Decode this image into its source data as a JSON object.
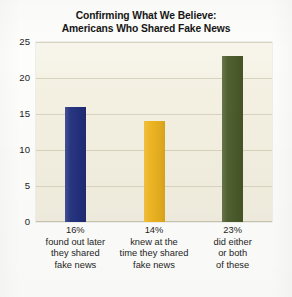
{
  "chart_data": {
    "type": "bar",
    "title": "Confirming What We Believe: Americans Who Shared Fake News",
    "title_lines": [
      "Confirming What We Believe:",
      "Americans Who Shared Fake News"
    ],
    "xlabel": "",
    "ylabel": "",
    "ylim": [
      0,
      25
    ],
    "yticks": [
      0,
      5,
      10,
      15,
      20,
      25
    ],
    "ytick_labels": [
      "0",
      "5",
      "10",
      "15",
      "20",
      "25"
    ],
    "grid": true,
    "legend": "none",
    "categories": [
      "16%",
      "14%",
      "23%"
    ],
    "values": [
      16,
      14,
      23
    ],
    "bars": [
      {
        "value": 16,
        "percent_label": "16%",
        "description_lines": [
          "found out later",
          "they shared",
          "fake news"
        ],
        "color": "#22307E"
      },
      {
        "value": 14,
        "percent_label": "14%",
        "description_lines": [
          "knew at the",
          "time they shared",
          "fake news"
        ],
        "color": "#EFB51F"
      },
      {
        "value": 23,
        "percent_label": "23%",
        "description_lines": [
          "did either",
          "or both",
          "of these"
        ],
        "color": "#4C5C2B"
      }
    ]
  },
  "style": {
    "plot_background": "#F4F1E2",
    "page_background": "#FDFDFB",
    "gridline_color": "#D8D3BD",
    "text_color": "#1A1A1A"
  }
}
